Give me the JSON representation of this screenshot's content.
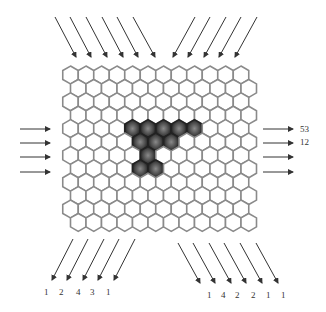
{
  "grid": {
    "rows": 12,
    "cols": 12,
    "origin_x": 70.5,
    "origin_y": 75,
    "hex_width": 15.5,
    "row_spacing": 13.4,
    "odd_row_offset": 7.75,
    "stroke_color": "#8a8a8a",
    "fill_color": "#ffffff",
    "filled_color": "#3a3a3a",
    "filled_cells": [
      [
        4,
        4
      ],
      [
        4,
        5
      ],
      [
        4,
        6
      ],
      [
        4,
        7
      ],
      [
        4,
        8
      ],
      [
        5,
        4
      ],
      [
        5,
        5
      ],
      [
        5,
        6
      ],
      [
        6,
        5
      ],
      [
        7,
        4
      ],
      [
        7,
        5
      ]
    ]
  },
  "arrows": {
    "color": "#333333",
    "top_left": [
      {
        "x1": 55,
        "y1": 17,
        "x2": 76,
        "y2": 57
      },
      {
        "x1": 70,
        "y1": 17,
        "x2": 91,
        "y2": 57
      },
      {
        "x1": 86,
        "y1": 17,
        "x2": 107,
        "y2": 57
      },
      {
        "x1": 102,
        "y1": 17,
        "x2": 123,
        "y2": 57
      },
      {
        "x1": 117,
        "y1": 17,
        "x2": 138,
        "y2": 57
      },
      {
        "x1": 133,
        "y1": 17,
        "x2": 155,
        "y2": 57
      }
    ],
    "top_right": [
      {
        "x1": 195,
        "y1": 17,
        "x2": 173,
        "y2": 57
      },
      {
        "x1": 210,
        "y1": 17,
        "x2": 188,
        "y2": 57
      },
      {
        "x1": 226,
        "y1": 17,
        "x2": 204,
        "y2": 57
      },
      {
        "x1": 241,
        "y1": 17,
        "x2": 219,
        "y2": 57
      },
      {
        "x1": 257,
        "y1": 17,
        "x2": 235,
        "y2": 57
      }
    ],
    "left": [
      {
        "x1": 20,
        "y1": 129,
        "x2": 50,
        "y2": 129
      },
      {
        "x1": 20,
        "y1": 143,
        "x2": 50,
        "y2": 143
      },
      {
        "x1": 20,
        "y1": 157,
        "x2": 50,
        "y2": 157
      },
      {
        "x1": 20,
        "y1": 172,
        "x2": 50,
        "y2": 172
      }
    ],
    "right": [
      {
        "x1": 263,
        "y1": 129,
        "x2": 293,
        "y2": 129
      },
      {
        "x1": 263,
        "y1": 143,
        "x2": 293,
        "y2": 143
      },
      {
        "x1": 263,
        "y1": 157,
        "x2": 293,
        "y2": 157
      },
      {
        "x1": 263,
        "y1": 172,
        "x2": 293,
        "y2": 172
      }
    ],
    "bottom_left": [
      {
        "x1": 73,
        "y1": 239,
        "x2": 52,
        "y2": 280
      },
      {
        "x1": 88,
        "y1": 239,
        "x2": 67,
        "y2": 280
      },
      {
        "x1": 104,
        "y1": 239,
        "x2": 83,
        "y2": 280
      },
      {
        "x1": 119,
        "y1": 239,
        "x2": 98,
        "y2": 280
      },
      {
        "x1": 135,
        "y1": 239,
        "x2": 114,
        "y2": 280
      }
    ],
    "bottom_right": [
      {
        "x1": 178,
        "y1": 243,
        "x2": 200,
        "y2": 283
      },
      {
        "x1": 193,
        "y1": 243,
        "x2": 215,
        "y2": 283
      },
      {
        "x1": 209,
        "y1": 243,
        "x2": 231,
        "y2": 283
      },
      {
        "x1": 224,
        "y1": 243,
        "x2": 246,
        "y2": 283
      },
      {
        "x1": 240,
        "y1": 243,
        "x2": 262,
        "y2": 283
      },
      {
        "x1": 256,
        "y1": 243,
        "x2": 278,
        "y2": 283
      }
    ]
  },
  "clues": {
    "right": [
      {
        "text": "53",
        "x": 300,
        "y": 125
      },
      {
        "text": "12",
        "x": 300,
        "y": 138
      }
    ],
    "bottom_left": [
      {
        "text": "1",
        "x": 44,
        "y": 288
      },
      {
        "text": "2",
        "x": 59,
        "y": 288
      },
      {
        "text": "4",
        "x": 76,
        "y": 288
      },
      {
        "text": "3",
        "x": 90,
        "y": 288
      },
      {
        "text": "1",
        "x": 106,
        "y": 288
      }
    ],
    "bottom_right": [
      {
        "text": "1",
        "x": 207,
        "y": 291
      },
      {
        "text": "4",
        "x": 221,
        "y": 291
      },
      {
        "text": "2",
        "x": 235,
        "y": 291
      },
      {
        "text": "2",
        "x": 251,
        "y": 291
      },
      {
        "text": "1",
        "x": 266,
        "y": 291
      },
      {
        "text": "1",
        "x": 281,
        "y": 291
      }
    ]
  }
}
